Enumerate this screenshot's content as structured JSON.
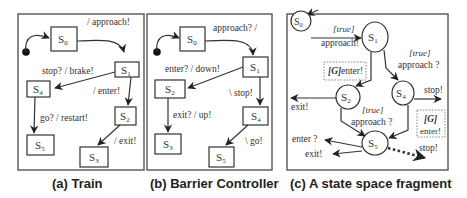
{
  "figure": {
    "panels": [
      {
        "id": "a",
        "caption": "(a) Train",
        "states": {
          "s0": "S",
          "s0_sub": "0",
          "s1": "S",
          "s1_sub": "1",
          "s2": "S",
          "s2_sub": "2",
          "s3": "S",
          "s3_sub": "3",
          "s4": "S",
          "s4_sub": "4",
          "s5": "S",
          "s5_sub": "5"
        },
        "transitions": {
          "s0_s1": "/ approach!",
          "s1_s4": "stop? / brake!",
          "s1_s2": "/ enter!",
          "s4_s5": "go? / restart!",
          "s2_s3": "/ exit!"
        }
      },
      {
        "id": "b",
        "caption": "(b) Barrier Controller",
        "states": {
          "s0": "S",
          "s0_sub": "0",
          "s1": "S",
          "s1_sub": "1",
          "s2": "S",
          "s2_sub": "2",
          "s3": "S",
          "s3_sub": "3",
          "s4": "S",
          "s4_sub": "4",
          "s5": "S",
          "s5_sub": "5"
        },
        "transitions": {
          "s0_s1": "approach? /",
          "s1_s2": "enter? / down!",
          "s1_s4": "\\ stop!",
          "s2_s3": "exit? / up!",
          "s4_s5": "\\ go!"
        }
      },
      {
        "id": "c",
        "caption": "(c) A state space fragment",
        "states": {
          "s0": "S",
          "s0_sub": "0",
          "s1": "S",
          "s1_sub": "1",
          "s2": "S",
          "s2_sub": "2",
          "s4": "S",
          "s4_sub": "4",
          "s5": "S",
          "s5_sub": "5"
        },
        "transitions": {
          "s0_s1_guard": "[true]",
          "s0_s1_action": "approach!",
          "s1_s2_guard": "[G]",
          "s1_s2_action": "enter!",
          "s1_s4_guard": "[true]",
          "s1_s4_action": "approach ?",
          "s2_exit": "exit!",
          "s4_stop": "stop!",
          "s2_s5_guard": "[true]",
          "s2_s5_action": "approach ?",
          "s4_s5_guard": "[G]",
          "s4_s5_action": "enter!",
          "s5_enter": "enter ?",
          "s5_exit": "exit!",
          "s5_stop": "stop!"
        }
      }
    ]
  }
}
